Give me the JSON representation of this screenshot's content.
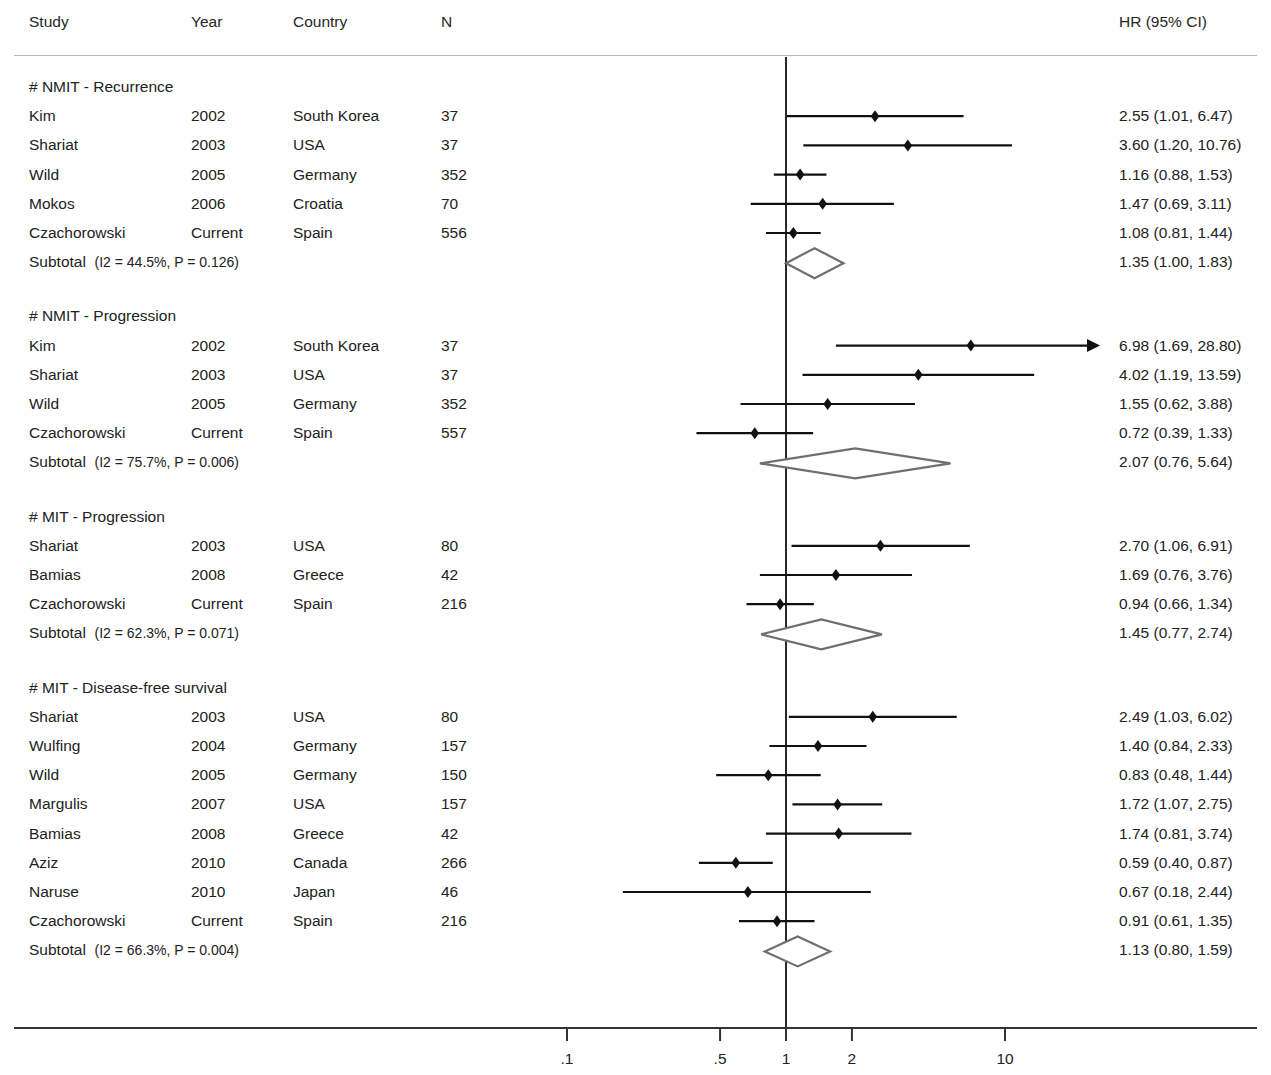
{
  "header": {
    "columns": {
      "study": "Study",
      "year": "Year",
      "country": "Country",
      "n": "N",
      "hr": "HR (95% CI)"
    }
  },
  "axis": {
    "scale": "log",
    "ticks": [
      {
        "label": ".1",
        "value": 0.1
      },
      {
        "label": ".5",
        "value": 0.5
      },
      {
        "label": "1",
        "value": 1
      },
      {
        "label": "2",
        "value": 2
      },
      {
        "label": "10",
        "value": 10
      }
    ],
    "reference_line_value": 1,
    "clip_max": 14.0
  },
  "colors": {
    "text": "#222222",
    "marker": "#111111",
    "ci_line": "#111111",
    "diamond_stroke": "#6f6f6f",
    "diamond_fill": "#ffffff",
    "rule": "#b9b9b9",
    "axis": "#333333"
  },
  "chart_data": {
    "type": "forest",
    "title": "",
    "xlabel": "",
    "ylabel": "",
    "effect_measure": "HR (95% CI)",
    "x_scale": "log",
    "xlim": [
      0.07,
      14.0
    ],
    "xticks": [
      0.1,
      0.5,
      1,
      2,
      10
    ],
    "xticklabels": [
      ".1",
      ".5",
      "1",
      "2",
      "10"
    ],
    "reference_line": 1,
    "grid": false,
    "legend": "none",
    "groups": [
      {
        "label": "# NMIT - Recurrence",
        "rows": [
          {
            "study": "Kim",
            "year": "2002",
            "country": "South Korea",
            "n": "37",
            "hr": 2.55,
            "lcl": 1.01,
            "ucl": 6.47,
            "hr_text": "2.55 (1.01, 6.47)",
            "clipped": false
          },
          {
            "study": "Shariat",
            "year": "2003",
            "country": "USA",
            "n": "37",
            "hr": 3.6,
            "lcl": 1.2,
            "ucl": 10.76,
            "hr_text": "3.60 (1.20, 10.76)",
            "clipped": false
          },
          {
            "study": "Wild",
            "year": "2005",
            "country": "Germany",
            "n": "352",
            "hr": 1.16,
            "lcl": 0.88,
            "ucl": 1.53,
            "hr_text": "1.16 (0.88, 1.53)",
            "clipped": false
          },
          {
            "study": "Mokos",
            "year": "2006",
            "country": "Croatia",
            "n": "70",
            "hr": 1.47,
            "lcl": 0.69,
            "ucl": 3.11,
            "hr_text": "1.47 (0.69, 3.11)",
            "clipped": false
          },
          {
            "study": "Czachorowski",
            "year": "Current",
            "country": "Spain",
            "n": "556",
            "hr": 1.08,
            "lcl": 0.81,
            "ucl": 1.44,
            "hr_text": "1.08 (0.81, 1.44)",
            "clipped": false
          }
        ],
        "subtotal": {
          "label": "Subtotal",
          "stats": "(I2 = 44.5%, P = 0.126)",
          "i2": "44.5%",
          "p": "0.126",
          "hr": 1.35,
          "lcl": 1.0,
          "ucl": 1.83,
          "hr_text": "1.35 (1.00, 1.83)"
        }
      },
      {
        "label": "# NMIT - Progression",
        "rows": [
          {
            "study": "Kim",
            "year": "2002",
            "country": "South Korea",
            "n": "37",
            "hr": 6.98,
            "lcl": 1.69,
            "ucl": 28.8,
            "hr_text": "6.98 (1.69, 28.80)",
            "clipped": true
          },
          {
            "study": "Shariat",
            "year": "2003",
            "country": "USA",
            "n": "37",
            "hr": 4.02,
            "lcl": 1.19,
            "ucl": 13.59,
            "hr_text": "4.02 (1.19, 13.59)",
            "clipped": false
          },
          {
            "study": "Wild",
            "year": "2005",
            "country": "Germany",
            "n": "352",
            "hr": 1.55,
            "lcl": 0.62,
            "ucl": 3.88,
            "hr_text": "1.55 (0.62, 3.88)",
            "clipped": false
          },
          {
            "study": "Czachorowski",
            "year": "Current",
            "country": "Spain",
            "n": "557",
            "hr": 0.72,
            "lcl": 0.39,
            "ucl": 1.33,
            "hr_text": "0.72 (0.39, 1.33)",
            "clipped": false
          }
        ],
        "subtotal": {
          "label": "Subtotal",
          "stats": "(I2 = 75.7%, P = 0.006)",
          "i2": "75.7%",
          "p": "0.006",
          "hr": 2.07,
          "lcl": 0.76,
          "ucl": 5.64,
          "hr_text": "2.07 (0.76, 5.64)"
        }
      },
      {
        "label": "# MIT - Progression",
        "rows": [
          {
            "study": "Shariat",
            "year": "2003",
            "country": "USA",
            "n": "80",
            "hr": 2.7,
            "lcl": 1.06,
            "ucl": 6.91,
            "hr_text": "2.70 (1.06, 6.91)",
            "clipped": false
          },
          {
            "study": "Bamias",
            "year": "2008",
            "country": "Greece",
            "n": "42",
            "hr": 1.69,
            "lcl": 0.76,
            "ucl": 3.76,
            "hr_text": "1.69 (0.76, 3.76)",
            "clipped": false
          },
          {
            "study": "Czachorowski",
            "year": "Current",
            "country": "Spain",
            "n": "216",
            "hr": 0.94,
            "lcl": 0.66,
            "ucl": 1.34,
            "hr_text": "0.94 (0.66, 1.34)",
            "clipped": false
          }
        ],
        "subtotal": {
          "label": "Subtotal",
          "stats": "(I2 = 62.3%, P = 0.071)",
          "i2": "62.3%",
          "p": "0.071",
          "hr": 1.45,
          "lcl": 0.77,
          "ucl": 2.74,
          "hr_text": "1.45 (0.77, 2.74)"
        }
      },
      {
        "label": "# MIT - Disease-free survival",
        "rows": [
          {
            "study": "Shariat",
            "year": "2003",
            "country": "USA",
            "n": "80",
            "hr": 2.49,
            "lcl": 1.03,
            "ucl": 6.02,
            "hr_text": "2.49 (1.03, 6.02)",
            "clipped": false
          },
          {
            "study": "Wulfing",
            "year": "2004",
            "country": "Germany",
            "n": "157",
            "hr": 1.4,
            "lcl": 0.84,
            "ucl": 2.33,
            "hr_text": "1.40 (0.84, 2.33)",
            "clipped": false
          },
          {
            "study": "Wild",
            "year": "2005",
            "country": "Germany",
            "n": "150",
            "hr": 0.83,
            "lcl": 0.48,
            "ucl": 1.44,
            "hr_text": "0.83 (0.48, 1.44)",
            "clipped": false
          },
          {
            "study": "Margulis",
            "year": "2007",
            "country": "USA",
            "n": "157",
            "hr": 1.72,
            "lcl": 1.07,
            "ucl": 2.75,
            "hr_text": "1.72 (1.07, 2.75)",
            "clipped": false
          },
          {
            "study": "Bamias",
            "year": "2008",
            "country": "Greece",
            "n": "42",
            "hr": 1.74,
            "lcl": 0.81,
            "ucl": 3.74,
            "hr_text": "1.74 (0.81, 3.74)",
            "clipped": false
          },
          {
            "study": "Aziz",
            "year": "2010",
            "country": "Canada",
            "n": "266",
            "hr": 0.59,
            "lcl": 0.4,
            "ucl": 0.87,
            "hr_text": "0.59 (0.40, 0.87)",
            "clipped": false
          },
          {
            "study": "Naruse",
            "year": "2010",
            "country": "Japan",
            "n": "46",
            "hr": 0.67,
            "lcl": 0.18,
            "ucl": 2.44,
            "hr_text": "0.67 (0.18, 2.44)",
            "clipped": false
          },
          {
            "study": "Czachorowski",
            "year": "Current",
            "country": "Spain",
            "n": "216",
            "hr": 0.91,
            "lcl": 0.61,
            "ucl": 1.35,
            "hr_text": "0.91 (0.61, 1.35)",
            "clipped": false
          }
        ],
        "subtotal": {
          "label": "Subtotal",
          "stats": "(I2 = 66.3%, P = 0.004)",
          "i2": "66.3%",
          "p": "0.004",
          "hr": 1.13,
          "lcl": 0.8,
          "ucl": 1.59,
          "hr_text": "1.13 (0.80, 1.59)"
        }
      }
    ]
  }
}
